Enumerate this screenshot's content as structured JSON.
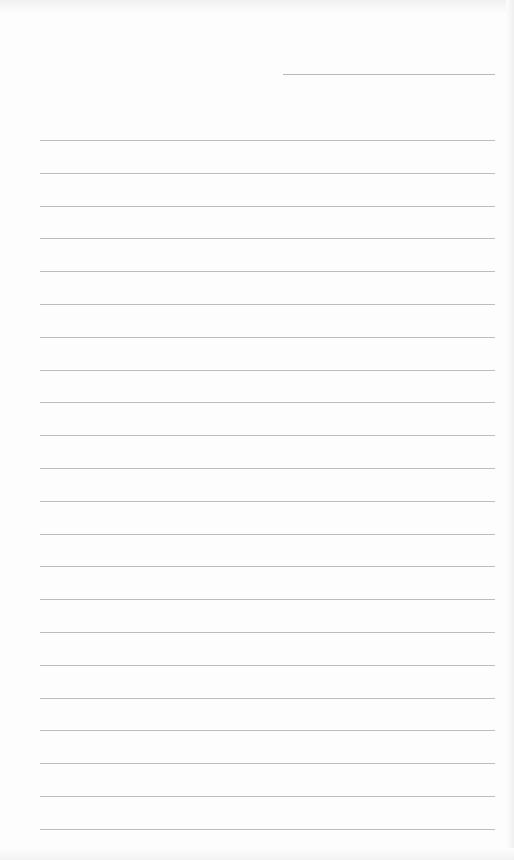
{
  "page": {
    "type": "lined-paper",
    "background_color": "#fdfdfd",
    "line_color": "#bdbdbd",
    "header_line": {
      "x": 283,
      "y": 74,
      "width": 212
    },
    "rules": {
      "count": 22,
      "first_y": 140,
      "spacing": 32.8,
      "x": 40,
      "width": 455
    }
  }
}
